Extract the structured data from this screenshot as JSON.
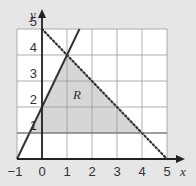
{
  "chart_data": {
    "type": "line",
    "title": "",
    "xlabel": "x",
    "ylabel": "y",
    "xlim": [
      -1,
      5
    ],
    "ylim": [
      0,
      5
    ],
    "grid": true,
    "x_ticks": [
      "-1",
      "0",
      "1",
      "2",
      "3",
      "4",
      "5"
    ],
    "y_ticks": [
      "1",
      "2",
      "3",
      "4",
      "5"
    ],
    "x_tick_values": [
      -1,
      0,
      1,
      2,
      3,
      4,
      5
    ],
    "y_tick_values": [
      1,
      2,
      3,
      4,
      5
    ],
    "series": [
      {
        "name": "y = 2x + 2",
        "style": "solid",
        "x": [
          -1,
          1.5
        ],
        "y": [
          0,
          5
        ]
      },
      {
        "name": "x + y = 5",
        "style": "dotted",
        "x": [
          0,
          5
        ],
        "y": [
          5,
          0
        ]
      },
      {
        "name": "y = 1",
        "style": "solid-thin",
        "x": [
          -1,
          5
        ],
        "y": [
          1,
          1
        ]
      }
    ],
    "region": {
      "label": "R",
      "vertices": [
        [
          -0.5,
          1
        ],
        [
          1,
          4
        ],
        [
          4,
          1
        ]
      ],
      "label_position": [
        1.4,
        2.3
      ]
    },
    "colors": {
      "background": "#e6e6e6",
      "plot_area": "#ffffff",
      "region_fill": "#d6d6d6",
      "grid": "#999999",
      "line": "#333333"
    }
  }
}
